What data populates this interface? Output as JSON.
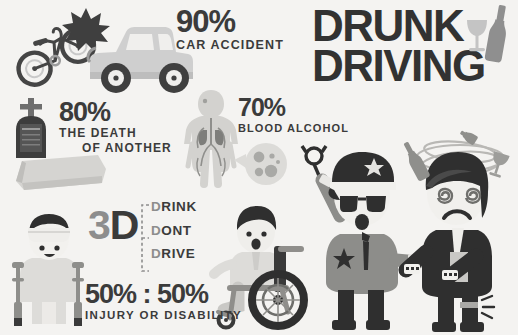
{
  "poster": {
    "background_color": "#f4f3f1",
    "ink_color": "#3b3b3b",
    "gray_color": "#8d8d8d",
    "width": 518,
    "height": 335
  },
  "title": {
    "line1": "DRUNK",
    "line2": "DRIVING"
  },
  "stats": [
    {
      "id": "car-accident",
      "percent": "90%",
      "label": "CAR ACCIDENT"
    },
    {
      "id": "death-of-another",
      "percent": "80%",
      "label_line1": "THE DEATH",
      "label_line2": "OF ANOTHER"
    },
    {
      "id": "blood-alcohol",
      "percent": "70%",
      "label": "BLOOD ALCOHOL"
    },
    {
      "id": "injury-or-disability",
      "percent": "50% : 50%",
      "label": "INJURY  OR  DISABILITY"
    }
  ],
  "slogan": {
    "abbreviation_number": "3",
    "abbreviation_letter": "D",
    "items": [
      {
        "lead": "D",
        "rest": "RINK"
      },
      {
        "lead": "D",
        "rest": "ONT"
      },
      {
        "lead": "D",
        "rest": "RIVE"
      }
    ]
  },
  "illustrations": [
    {
      "name": "bicycle",
      "caption": "bicycle thrown in collision"
    },
    {
      "name": "impact-burst",
      "caption": "collision impact starburst"
    },
    {
      "name": "jeep",
      "caption": "grey jeep / suv"
    },
    {
      "name": "tombstone",
      "caption": "grave headstone with cross"
    },
    {
      "name": "coffin",
      "caption": "coffin"
    },
    {
      "name": "anatomy-body",
      "caption": "human body with circulatory system and lungs"
    },
    {
      "name": "blood-cells-magnifier",
      "caption": "magnified blood cells"
    },
    {
      "name": "crutches-man",
      "caption": "injured man with head bandage on crutches"
    },
    {
      "name": "wheelchair-man",
      "caption": "disabled man in a wheelchair"
    },
    {
      "name": "police-officer",
      "caption": "police officer holding handcuffs"
    },
    {
      "name": "handcuffs",
      "caption": "handcuffs"
    },
    {
      "name": "drunk-man",
      "caption": "dizzy drunk man with spiral eyes"
    },
    {
      "name": "dizzy-swirl",
      "caption": "dizziness swirl around head"
    },
    {
      "name": "wine-glass-title",
      "caption": "wine glass beside title"
    },
    {
      "name": "bottle-title",
      "caption": "liquor bottle beside title"
    },
    {
      "name": "floating-bottle",
      "caption": "floating bottle near drunk man"
    },
    {
      "name": "floating-glass",
      "caption": "floating glass near drunk man"
    },
    {
      "name": "pain-spark",
      "caption": "pain spark at leg"
    }
  ]
}
